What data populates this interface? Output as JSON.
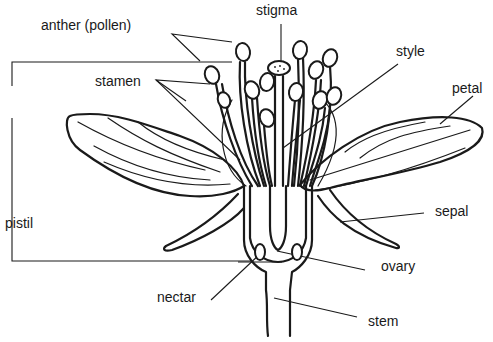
{
  "diagram": {
    "labels": {
      "anther": "anther (pollen)",
      "stigma": "stigma",
      "stamen": "stamen",
      "style": "style",
      "petal": "petal",
      "pistil": "pistil",
      "sepal": "sepal",
      "ovary": "ovary",
      "nectar": "nectar",
      "stem": "stem"
    },
    "colors": {
      "ink": "#1a1a1a",
      "background": "#ffffff"
    }
  }
}
